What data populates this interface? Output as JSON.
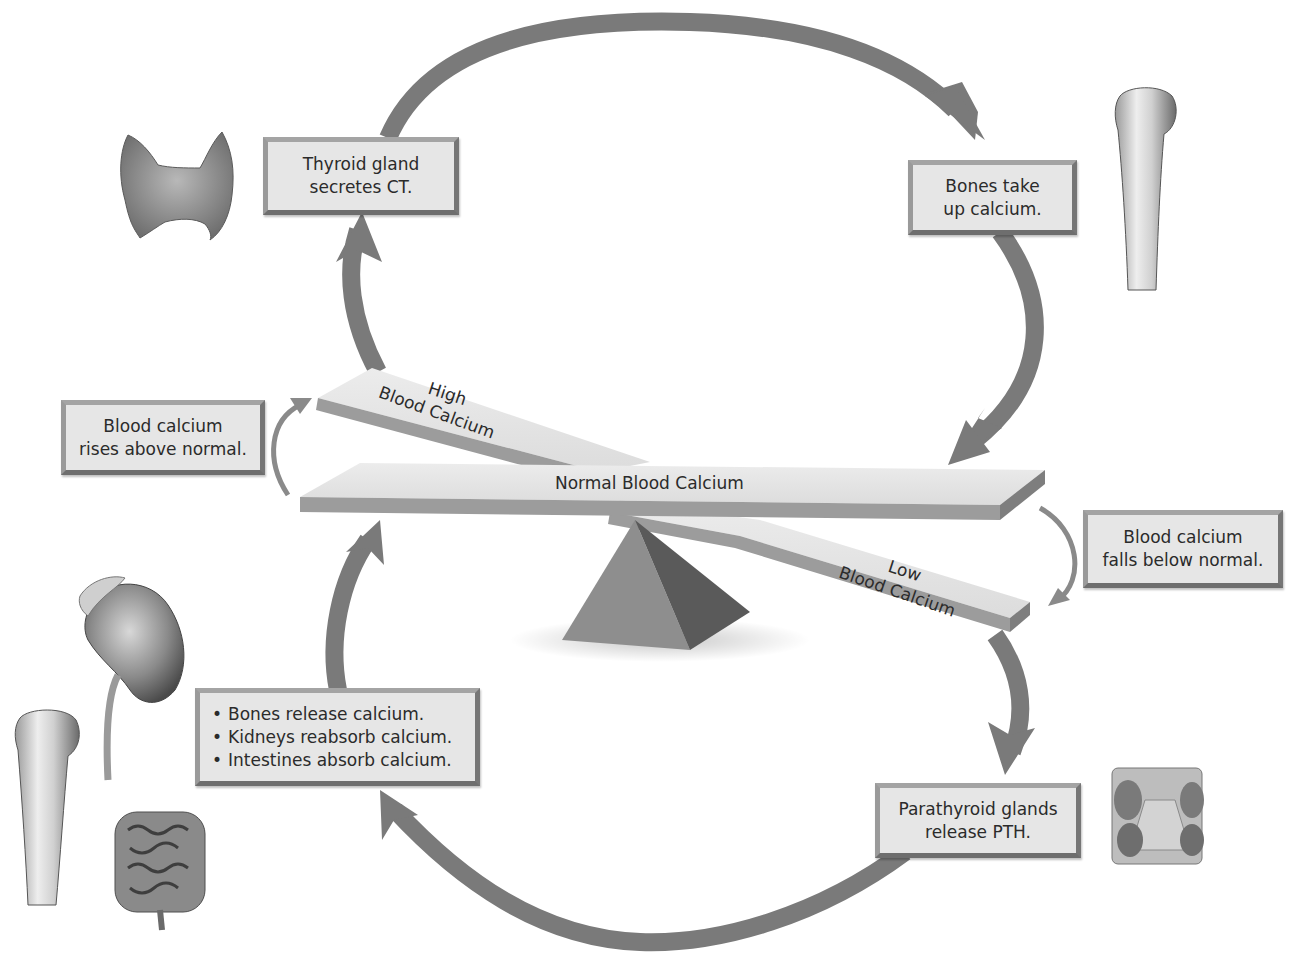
{
  "diagram": {
    "type": "negative-feedback-loop",
    "topic": "Calcium homeostasis",
    "colors": {
      "arrow": "#7a7a7a",
      "arrow_thin": "#8a8a8a",
      "box_fill": "#e6e6e6",
      "box_border": "#8c8c8c",
      "plank_top": "#e4e4e4",
      "plank_edge": "#9c9c9c",
      "fulcrum_light": "#8e8e8e",
      "fulcrum_dark": "#5a5a5a",
      "text": "#2b2b2b"
    }
  },
  "boxes": {
    "thyroid": {
      "line1": "Thyroid gland",
      "line2": "secretes CT."
    },
    "bones_uptake": {
      "line1": "Bones take",
      "line2": "up calcium."
    },
    "rises": {
      "line1": "Blood calcium",
      "line2": "rises above normal."
    },
    "falls": {
      "line1": "Blood calcium",
      "line2": "falls below normal."
    },
    "release_list": {
      "items": [
        "Bones release calcium.",
        "Kidneys reabsorb calcium.",
        "Intestines absorb calcium."
      ]
    },
    "parathyroid": {
      "line1": "Parathyroid glands",
      "line2": "release PTH."
    }
  },
  "seesaw": {
    "normal_label": "Normal Blood Calcium",
    "high_label_line1": "High",
    "high_label_line2": "Blood Calcium",
    "low_label_line1": "Low",
    "low_label_line2": "Blood Calcium"
  },
  "illustrations": [
    {
      "name": "thyroid-gland",
      "position": "top-left"
    },
    {
      "name": "bone-humerus",
      "position": "top-right"
    },
    {
      "name": "kidney",
      "position": "bottom-left"
    },
    {
      "name": "bone-humerus",
      "position": "bottom-left"
    },
    {
      "name": "intestines",
      "position": "bottom-left"
    },
    {
      "name": "parathyroid-glands",
      "position": "bottom-right"
    }
  ],
  "flow": [
    "Blood calcium rises above normal.",
    "Thyroid gland secretes CT.",
    "Bones take up calcium.",
    "Normal Blood Calcium",
    "Blood calcium falls below normal.",
    "Parathyroid glands release PTH.",
    "Bones release calcium. Kidneys reabsorb calcium. Intestines absorb calcium.",
    "Normal Blood Calcium"
  ]
}
